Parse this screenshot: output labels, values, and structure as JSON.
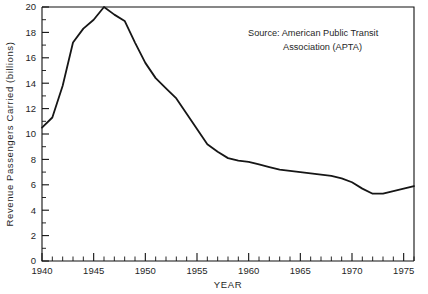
{
  "chart_data": {
    "type": "line",
    "title": "",
    "xlabel": "YEAR",
    "ylabel": "Revenue Passengers Carried (billions)",
    "xlim": [
      1940,
      1976
    ],
    "ylim": [
      0,
      20
    ],
    "grid": false,
    "legend": null,
    "annotations": [
      {
        "name": "source-note",
        "line1": "Source: American Public Transit",
        "line2": "Association (APTA)"
      }
    ],
    "x_major_ticks": [
      1940,
      1945,
      1950,
      1955,
      1960,
      1965,
      1970,
      1975
    ],
    "x_tick_labels": [
      "1940",
      "1945",
      "1950",
      "1955",
      "1960",
      "1965",
      "1970",
      "1975"
    ],
    "x_minor_step": 1,
    "y_major_ticks": [
      0,
      2,
      4,
      6,
      8,
      10,
      12,
      14,
      16,
      18,
      20
    ],
    "y_tick_labels": [
      "0",
      "2",
      "4",
      "6",
      "8",
      "10",
      "12",
      "14",
      "16",
      "18",
      "20"
    ],
    "y_minor_step": 1,
    "series": [
      {
        "name": "Revenue Passengers Carried",
        "color": "#161616",
        "x": [
          1940,
          1941,
          1942,
          1943,
          1944,
          1945,
          1946,
          1947,
          1948,
          1949,
          1950,
          1951,
          1952,
          1953,
          1954,
          1955,
          1956,
          1957,
          1958,
          1959,
          1960,
          1961,
          1962,
          1963,
          1964,
          1965,
          1966,
          1967,
          1968,
          1969,
          1970,
          1971,
          1972,
          1973,
          1974,
          1975,
          1976
        ],
        "values": [
          10.5,
          11.3,
          13.8,
          17.2,
          18.3,
          19.0,
          20.0,
          19.4,
          18.9,
          17.2,
          15.6,
          14.4,
          13.6,
          12.8,
          11.6,
          10.4,
          9.2,
          8.6,
          8.1,
          7.9,
          7.8,
          7.6,
          7.4,
          7.2,
          7.1,
          7.0,
          6.9,
          6.8,
          6.7,
          6.5,
          6.2,
          5.7,
          5.3,
          5.3,
          5.5,
          5.7,
          5.9
        ]
      }
    ]
  },
  "axes": {
    "y_axis_title": "Revenue Passengers Carried (billions)",
    "x_axis_title": "YEAR"
  }
}
